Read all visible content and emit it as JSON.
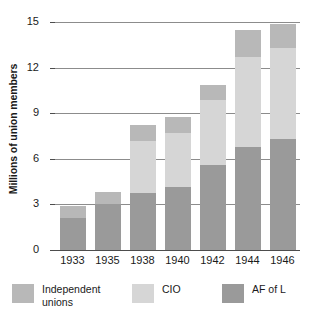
{
  "chart_data": {
    "type": "bar",
    "subtype": "stacked-vertical",
    "title": "",
    "xlabel": "",
    "ylabel": "Millions of union members",
    "categories": [
      "1933",
      "1935",
      "1938",
      "1940",
      "1942",
      "1944",
      "1946"
    ],
    "series": [
      {
        "name": "AF of L",
        "color": "#9a9a9a",
        "values": [
          2.1,
          3.0,
          3.75,
          4.15,
          5.6,
          6.8,
          7.3
        ]
      },
      {
        "name": "CIO",
        "color": "#d6d6d6",
        "values": [
          0.0,
          0.0,
          3.45,
          3.55,
          4.3,
          5.9,
          6.0
        ]
      },
      {
        "name": "Independent unions",
        "color": "#b8b8b8",
        "values": [
          0.8,
          0.8,
          1.0,
          1.05,
          0.95,
          1.8,
          1.55
        ]
      }
    ],
    "totals": [
      2.9,
      3.8,
      8.2,
      8.75,
      10.85,
      14.5,
      14.85
    ],
    "ylim": [
      0,
      15
    ],
    "yticks": [
      0,
      3,
      6,
      9,
      12,
      15
    ],
    "ytick_labels": [
      "0",
      "3",
      "6",
      "9",
      "12",
      "15"
    ],
    "grid": true,
    "legend_position": "bottom"
  },
  "axis": {
    "y_title": "Millions of union members"
  },
  "legend": {
    "items": [
      {
        "label": "Independent\nunions",
        "color": "#b8b8b8"
      },
      {
        "label": "CIO",
        "color": "#d6d6d6"
      },
      {
        "label": "AF of L",
        "color": "#9a9a9a"
      }
    ]
  },
  "colors": {
    "afl": "#9a9a9a",
    "cio": "#d6d6d6",
    "independent": "#b8b8b8",
    "gridline": "#8c8c8c",
    "axis": "#4d4d4d",
    "text": "#1a1a1a",
    "background": "#ffffff"
  }
}
